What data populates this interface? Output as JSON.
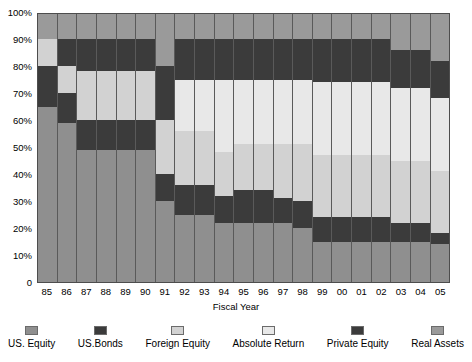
{
  "chart_data": {
    "type": "bar",
    "subtype": "stacked-percentage",
    "title": "",
    "xlabel": "Fiscal Year",
    "ylabel": "",
    "ylim": [
      0,
      100
    ],
    "yticks": [
      "0",
      "10%",
      "20%",
      "30%",
      "40%",
      "50%",
      "60%",
      "70%",
      "80%",
      "90%",
      "100%"
    ],
    "ytick_values": [
      0,
      10,
      20,
      30,
      40,
      50,
      60,
      70,
      80,
      90,
      100
    ],
    "grid": false,
    "legend_position": "bottom",
    "categories": [
      "85",
      "86",
      "87",
      "88",
      "89",
      "90",
      "91",
      "92",
      "93",
      "94",
      "95",
      "96",
      "97",
      "98",
      "99",
      "00",
      "01",
      "02",
      "03",
      "04",
      "05"
    ],
    "series": [
      {
        "name": "US. Equity",
        "color": "#8f8f8f",
        "values": [
          65,
          59,
          49,
          49,
          49,
          49,
          30,
          25,
          25,
          22,
          22,
          22,
          22,
          20,
          15,
          15,
          15,
          15,
          15,
          15,
          14
        ]
      },
      {
        "name": "US.Bonds",
        "color": "#3b3b3b",
        "values": [
          15,
          11,
          11,
          11,
          11,
          11,
          10,
          11,
          11,
          10,
          12,
          12,
          9,
          10,
          9,
          9,
          9,
          9,
          7,
          7,
          4
        ]
      },
      {
        "name": "Foreign Equity",
        "color": "#d2d2d2",
        "values": [
          10,
          10,
          18,
          18,
          18,
          18,
          20,
          20,
          20,
          16,
          17,
          17,
          20,
          21,
          23,
          23,
          23,
          23,
          23,
          23,
          23
        ]
      },
      {
        "name": "Absolute Return",
        "color": "#e8e8e8",
        "values": [
          0,
          0,
          0,
          0,
          0,
          0,
          0,
          19,
          19,
          27,
          24,
          24,
          24,
          24,
          27,
          27,
          27,
          27,
          27,
          27,
          27
        ]
      },
      {
        "name": "Private Equity",
        "color": "#3b3b3b",
        "values": [
          0,
          10,
          12,
          12,
          12,
          12,
          20,
          15,
          15,
          15,
          15,
          15,
          15,
          15,
          16,
          16,
          16,
          16,
          14,
          14,
          14
        ]
      },
      {
        "name": "Real Assets",
        "color": "#9a9a9a",
        "values": [
          10,
          10,
          10,
          10,
          10,
          10,
          20,
          10,
          10,
          10,
          10,
          10,
          10,
          10,
          10,
          10,
          10,
          10,
          14,
          14,
          18
        ]
      }
    ],
    "stack_boundaries": [
      [
        0,
        65,
        80,
        90,
        90,
        90,
        100
      ],
      [
        0,
        59,
        70,
        80,
        80,
        90,
        100
      ],
      [
        0,
        49,
        60,
        78,
        78,
        90,
        100
      ],
      [
        0,
        49,
        60,
        78,
        78,
        90,
        100
      ],
      [
        0,
        49,
        60,
        78,
        78,
        90,
        100
      ],
      [
        0,
        49,
        60,
        78,
        78,
        90,
        100
      ],
      [
        0,
        30,
        40,
        60,
        60,
        80,
        100
      ],
      [
        0,
        25,
        36,
        56,
        75,
        90,
        100
      ],
      [
        0,
        25,
        36,
        56,
        75,
        90,
        100
      ],
      [
        0,
        22,
        32,
        48,
        75,
        90,
        100
      ],
      [
        0,
        22,
        34,
        51,
        75,
        90,
        100
      ],
      [
        0,
        22,
        34,
        51,
        75,
        90,
        100
      ],
      [
        0,
        22,
        31,
        51,
        75,
        90,
        100
      ],
      [
        0,
        20,
        30,
        51,
        75,
        90,
        100
      ],
      [
        0,
        15,
        24,
        47,
        74,
        90,
        100
      ],
      [
        0,
        15,
        24,
        47,
        74,
        90,
        100
      ],
      [
        0,
        15,
        24,
        47,
        74,
        90,
        100
      ],
      [
        0,
        15,
        24,
        47,
        74,
        90,
        100
      ],
      [
        0,
        15,
        22,
        45,
        72,
        86,
        100
      ],
      [
        0,
        15,
        22,
        45,
        72,
        86,
        100
      ],
      [
        0,
        14,
        18,
        41,
        68,
        82,
        100
      ]
    ]
  },
  "legend": {
    "items": [
      {
        "label": "US. Equity"
      },
      {
        "label": "US.Bonds"
      },
      {
        "label": "Foreign Equity"
      },
      {
        "label": "Absolute Return"
      },
      {
        "label": "Private Equity"
      },
      {
        "label": "Real Assets"
      }
    ]
  },
  "axis": {
    "x_title": "Fiscal Year"
  }
}
